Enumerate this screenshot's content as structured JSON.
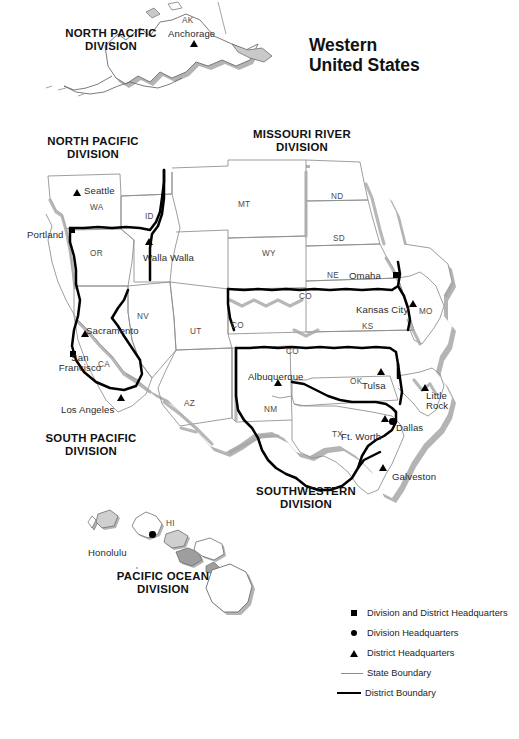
{
  "title": {
    "line1": "Western",
    "line2": "United States"
  },
  "divisions": [
    {
      "name": "north-pacific-alaska",
      "line1": "NORTH PACIFIC",
      "line2": "DIVISION",
      "x": 40,
      "y": 27
    },
    {
      "name": "north-pacific",
      "line1": "NORTH PACIFIC",
      "line2": "DIVISION",
      "x": 22,
      "y": 135
    },
    {
      "name": "missouri-river",
      "line1": "MISSOURI RIVER",
      "line2": "DIVISION",
      "x": 227,
      "y": 128
    },
    {
      "name": "south-pacific",
      "line1": "SOUTH PACIFIC",
      "line2": "DIVISION",
      "x": 20,
      "y": 432
    },
    {
      "name": "southwestern",
      "line1": "SOUTHWESTERN",
      "line2": "DIVISION",
      "x": 231,
      "y": 485
    },
    {
      "name": "pacific-ocean",
      "line1": "PACIFIC OCEAN",
      "line2": "DIVISION",
      "x": 88,
      "y": 570
    }
  ],
  "cities": [
    {
      "name": "anchorage",
      "label": "Anchorage",
      "lx": 168,
      "ly": 29,
      "mx": 190,
      "my": 40,
      "marker": "triangle"
    },
    {
      "name": "seattle",
      "label": "Seattle",
      "lx": 84,
      "ly": 186,
      "mx": 73,
      "my": 189,
      "marker": "triangle"
    },
    {
      "name": "portland",
      "label": "Portland",
      "lx": 27,
      "ly": 230,
      "mx": 69,
      "my": 227,
      "marker": "square"
    },
    {
      "name": "walla-walla",
      "label": "Walla Walla",
      "lx": 143,
      "ly": 253,
      "mx": 145,
      "my": 238,
      "marker": "triangle"
    },
    {
      "name": "omaha",
      "label": "Omaha",
      "lx": 349,
      "ly": 271,
      "mx": 393,
      "my": 272,
      "marker": "square"
    },
    {
      "name": "kansas-city",
      "label": "Kansas City",
      "lx": 356,
      "ly": 305,
      "mx": 409,
      "my": 300,
      "marker": "triangle"
    },
    {
      "name": "sacramento",
      "label": "Sacramento",
      "lx": 86,
      "ly": 326,
      "mx": 81,
      "my": 330,
      "marker": "triangle"
    },
    {
      "name": "san-francisco",
      "label": "San",
      "label2": "Francisco",
      "lx": 52,
      "ly": 353,
      "mx": 70,
      "my": 351,
      "marker": "square"
    },
    {
      "name": "tulsa",
      "label": "Tulsa",
      "lx": 362,
      "ly": 381,
      "mx": 377,
      "my": 368,
      "marker": "triangle"
    },
    {
      "name": "albuquerque",
      "label": "Albuquerque",
      "lx": 248,
      "ly": 372,
      "mx": 274,
      "my": 379,
      "marker": "triangle"
    },
    {
      "name": "little-rock",
      "label": "Little",
      "label2": "Rock",
      "lx": 426,
      "ly": 391,
      "mx": 421,
      "my": 384,
      "marker": "triangle"
    },
    {
      "name": "los-angeles",
      "label": "Los Angeles",
      "lx": 61,
      "ly": 405,
      "mx": 117,
      "my": 394,
      "marker": "triangle"
    },
    {
      "name": "dallas",
      "label": "Dallas",
      "lx": 396,
      "ly": 423,
      "mx": 389,
      "my": 418,
      "marker": "circle"
    },
    {
      "name": "ft-worth",
      "label": "Ft. Worth",
      "lx": 341,
      "ly": 432,
      "mx": 381,
      "my": 415,
      "marker": "triangle"
    },
    {
      "name": "galveston",
      "label": "Galveston",
      "lx": 392,
      "ly": 472,
      "mx": 379,
      "my": 464,
      "marker": "triangle"
    },
    {
      "name": "honolulu",
      "label": "Honolulu",
      "lx": 88,
      "ly": 548,
      "mx": 149,
      "my": 531,
      "marker": "circle"
    }
  ],
  "states": [
    {
      "abbr": "AK",
      "x": 182,
      "y": 16
    },
    {
      "abbr": "WA",
      "x": 90,
      "y": 203
    },
    {
      "abbr": "ID",
      "x": 145,
      "y": 212
    },
    {
      "abbr": "OR",
      "x": 90,
      "y": 249
    },
    {
      "abbr": "MT",
      "x": 238,
      "y": 200
    },
    {
      "abbr": "ND",
      "x": 331,
      "y": 192
    },
    {
      "abbr": "SD",
      "x": 333,
      "y": 234
    },
    {
      "abbr": "WY",
      "x": 262,
      "y": 249
    },
    {
      "abbr": "NE",
      "x": 327,
      "y": 271
    },
    {
      "abbr": "CO",
      "x": 299,
      "y": 292
    },
    {
      "abbr": "CO",
      "x": 231,
      "y": 321
    },
    {
      "abbr": "CO",
      "x": 286,
      "y": 347
    },
    {
      "abbr": "KS",
      "x": 362,
      "y": 322
    },
    {
      "abbr": "MO",
      "x": 419,
      "y": 307
    },
    {
      "abbr": "NV",
      "x": 137,
      "y": 312
    },
    {
      "abbr": "UT",
      "x": 190,
      "y": 327
    },
    {
      "abbr": "CA",
      "x": 98,
      "y": 360
    },
    {
      "abbr": "AZ",
      "x": 184,
      "y": 399
    },
    {
      "abbr": "NM",
      "x": 264,
      "y": 405
    },
    {
      "abbr": "OK",
      "x": 350,
      "y": 377
    },
    {
      "abbr": "TX",
      "x": 332,
      "y": 430
    },
    {
      "abbr": "HI",
      "x": 166,
      "y": 519
    }
  ],
  "legend": {
    "items": [
      {
        "symbol": "square",
        "label": "Division and District Headquarters"
      },
      {
        "symbol": "circle",
        "label": "Division Headquarters"
      },
      {
        "symbol": "triangle",
        "label": "District Headquarters"
      },
      {
        "symbol": "thin-line",
        "label": "State Boundary"
      },
      {
        "symbol": "thick-line",
        "label": "District Boundary"
      }
    ]
  },
  "colors": {
    "state_boundary": "#8d8d8d",
    "district_boundary": "#000000",
    "shadow": "#a8a8a8",
    "land": "#ffffff",
    "text": "#1a1a1a"
  }
}
